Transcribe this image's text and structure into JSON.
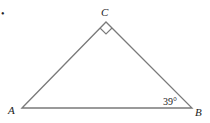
{
  "diagram": {
    "type": "right-triangle",
    "bullet": "•",
    "vertices": {
      "A": {
        "label": "A"
      },
      "B": {
        "label": "B"
      },
      "C": {
        "label": "C"
      }
    },
    "angle_B": {
      "label": "39°"
    },
    "right_angle_at": "C",
    "colors": {
      "stroke": "#7a7a7a",
      "text": "#222222"
    }
  }
}
